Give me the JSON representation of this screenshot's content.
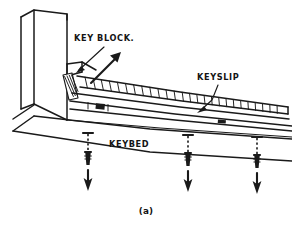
{
  "figure": {
    "caption": "(a)",
    "background_color": "#ffffff",
    "ink_color": "#1a1a1a",
    "style": "hand-drawn line illustration, perspective view"
  },
  "labels": [
    {
      "id": "key-block",
      "text": "KEY BLOCK.",
      "x": 74,
      "y": 41,
      "leader": "points down-left to block at front-left of keybed"
    },
    {
      "id": "keyslip",
      "text": "KEYSLIP",
      "x": 197,
      "y": 80,
      "leader": "points down-left to segmented strip"
    },
    {
      "id": "keybed",
      "text": "KEYBED",
      "x": 109,
      "y": 147,
      "leader": "none"
    }
  ],
  "annotations": {
    "removal_arrow": {
      "name": "removal-direction-arrow",
      "description": "thick arrow pointing up and to the right from key block",
      "direction": "up-right"
    },
    "screws": [
      {
        "id": "screw-1",
        "x": 88,
        "description": "screw with dashed shaft and downward arrow"
      },
      {
        "id": "screw-2",
        "x": 188,
        "description": "screw with dashed shaft and downward arrow"
      },
      {
        "id": "screw-3",
        "x": 257,
        "description": "screw with dashed shaft and downward arrow"
      }
    ],
    "screw_count": 3,
    "screw_arrow_direction": "down"
  },
  "geometry": {
    "cheek_post": {
      "name": "left-vertical-cheek-block",
      "top_y": 12,
      "bottom_y": 122
    },
    "keyslip_strip": {
      "name": "segmented-keyslip",
      "segment_count": 26,
      "left_x": 78,
      "right_x": 278
    },
    "end_section": {
      "name": "hatched-end-section",
      "hatch_lines": 4
    },
    "dark_block": {
      "name": "dark-filled-block-on-lower-rail",
      "x": 98,
      "y": 108
    }
  }
}
